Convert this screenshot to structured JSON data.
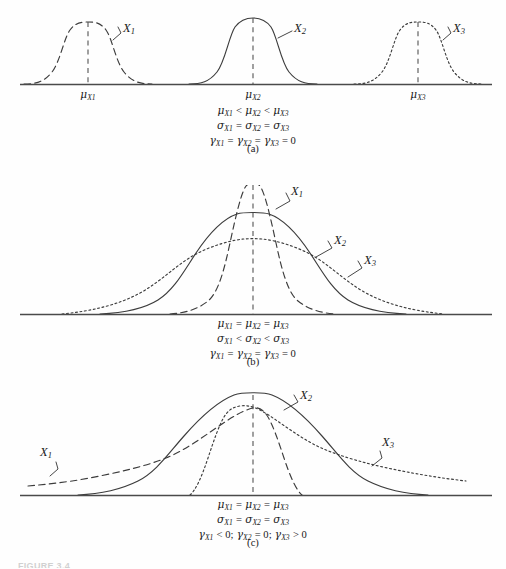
{
  "figure": {
    "background_color": "#fefefe",
    "ink_color": "#3c3c3c",
    "caption_partial": "FIGURE 3.4"
  },
  "panels": [
    {
      "tag": "(a)",
      "curves": [
        {
          "label": "X",
          "sub": "1",
          "style": "dashed",
          "mean_label_mu": "μ",
          "mean_label_sub": "X1"
        },
        {
          "label": "X",
          "sub": "2",
          "style": "solid",
          "mean_label_mu": "μ",
          "mean_label_sub": "X2"
        },
        {
          "label": "X",
          "sub": "3",
          "style": "dotted",
          "mean_label_mu": "μ",
          "mean_label_sub": "X3"
        }
      ],
      "mean_labels": [
        {
          "mu": "μ",
          "sub": "X1"
        },
        {
          "mu": "μ",
          "sub": "X2"
        },
        {
          "mu": "μ",
          "sub": "X3"
        }
      ],
      "equations": [
        [
          {
            "g": "μ",
            "s": "X1"
          },
          {
            "op": " < "
          },
          {
            "g": "μ",
            "s": "X2"
          },
          {
            "op": " < "
          },
          {
            "g": "μ",
            "s": "X3"
          }
        ],
        [
          {
            "g": "σ",
            "s": "X1"
          },
          {
            "op": " = "
          },
          {
            "g": "σ",
            "s": "X2"
          },
          {
            "op": " = "
          },
          {
            "g": "σ",
            "s": "X3"
          }
        ],
        [
          {
            "g": "γ",
            "s": "X1"
          },
          {
            "op": " = "
          },
          {
            "g": "γ",
            "s": "X2"
          },
          {
            "op": " = "
          },
          {
            "g": "γ",
            "s": "X3"
          },
          {
            "op": " = 0"
          }
        ]
      ]
    },
    {
      "tag": "(b)",
      "curves": [
        {
          "label": "X",
          "sub": "1",
          "style": "dashed"
        },
        {
          "label": "X",
          "sub": "2",
          "style": "solid"
        },
        {
          "label": "X",
          "sub": "3",
          "style": "dotted"
        }
      ],
      "equations": [
        [
          {
            "g": "μ",
            "s": "X1"
          },
          {
            "op": " = "
          },
          {
            "g": "μ",
            "s": "X2"
          },
          {
            "op": " = "
          },
          {
            "g": "μ",
            "s": "X3"
          }
        ],
        [
          {
            "g": "σ",
            "s": "X1"
          },
          {
            "op": " < "
          },
          {
            "g": "σ",
            "s": "X2"
          },
          {
            "op": " < "
          },
          {
            "g": "σ",
            "s": "X3"
          }
        ],
        [
          {
            "g": "γ",
            "s": "X1"
          },
          {
            "op": " = "
          },
          {
            "g": "γ",
            "s": "X2"
          },
          {
            "op": " = "
          },
          {
            "g": "γ",
            "s": "X3"
          },
          {
            "op": " = 0"
          }
        ]
      ]
    },
    {
      "tag": "(c)",
      "curves": [
        {
          "label": "X",
          "sub": "1",
          "style": "dashed"
        },
        {
          "label": "X",
          "sub": "2",
          "style": "solid"
        },
        {
          "label": "X",
          "sub": "3",
          "style": "dotted"
        }
      ],
      "equations": [
        [
          {
            "g": "μ",
            "s": "X1"
          },
          {
            "op": " = "
          },
          {
            "g": "μ",
            "s": "X2"
          },
          {
            "op": " = "
          },
          {
            "g": "μ",
            "s": "X3"
          }
        ],
        [
          {
            "g": "σ",
            "s": "X1"
          },
          {
            "op": " = "
          },
          {
            "g": "σ",
            "s": "X2"
          },
          {
            "op": " = "
          },
          {
            "g": "σ",
            "s": "X3"
          }
        ],
        [
          {
            "g": "γ",
            "s": "X1"
          },
          {
            "op": " < 0; "
          },
          {
            "g": "γ",
            "s": "X2"
          },
          {
            "op": " = 0; "
          },
          {
            "g": "γ",
            "s": "X3"
          },
          {
            "op": " > 0"
          }
        ]
      ]
    }
  ],
  "chart_data": {
    "type": "line",
    "xlabel": "",
    "ylabel": "",
    "grid": false,
    "legend": "inline annotations",
    "panels": [
      {
        "id": "a",
        "tag": "(a)",
        "description": "Three normal pdfs with equal standard deviation and zero skew, differing means",
        "axis_baseline_y": 84,
        "axis_x_range": [
          20,
          492
        ],
        "series": [
          {
            "name": "X1",
            "style": "dashed",
            "mean": 88,
            "sigma": 28,
            "peak_height": 62,
            "skew": 0
          },
          {
            "name": "X2",
            "style": "solid",
            "mean": 253,
            "sigma": 28,
            "peak_height": 66,
            "skew": 0
          },
          {
            "name": "X3",
            "style": "dotted",
            "mean": 418,
            "sigma": 28,
            "peak_height": 62,
            "skew": 0
          }
        ]
      },
      {
        "id": "b",
        "tag": "(b)",
        "description": "Three pdfs with equal mean and zero skew, increasing standard deviation",
        "axis_baseline_y": 314,
        "axis_x_range": [
          20,
          492
        ],
        "series": [
          {
            "name": "X1",
            "style": "dashed",
            "mean": 253,
            "sigma": 22,
            "peak_height": 130,
            "skew": 0
          },
          {
            "name": "X2",
            "style": "solid",
            "mean": 253,
            "sigma": 41,
            "peak_height": 96,
            "skew": 0
          },
          {
            "name": "X3",
            "style": "dotted",
            "mean": 253,
            "sigma": 66,
            "peak_height": 70,
            "skew": 0
          }
        ]
      },
      {
        "id": "c",
        "tag": "(c)",
        "description": "Three pdfs with equal mean and standard deviation, differing skewness",
        "axis_baseline_y": 495,
        "axis_x_range": [
          20,
          492
        ],
        "series": [
          {
            "name": "X1",
            "style": "dashed",
            "mean": 253,
            "sigma": 36,
            "peak_height": 72,
            "skew": -1
          },
          {
            "name": "X2",
            "style": "solid",
            "mean": 253,
            "sigma": 48,
            "peak_height": 88,
            "skew": 0
          },
          {
            "name": "X3",
            "style": "dotted",
            "mean": 253,
            "sigma": 36,
            "peak_height": 68,
            "skew": 1
          }
        ]
      }
    ]
  }
}
